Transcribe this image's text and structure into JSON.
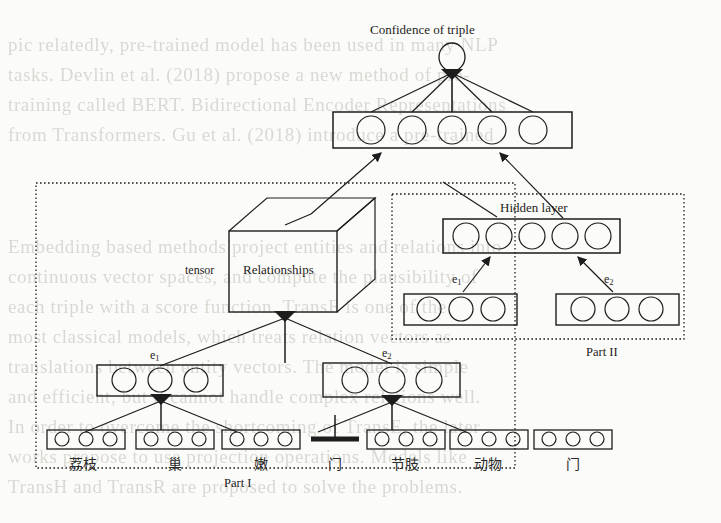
{
  "figure": {
    "title_top": "Confidence of triple",
    "cube_label": "Relationships",
    "tensor_label": "tensor",
    "hidden_layer_label": "Hidden layer",
    "part_i_label": "Part I",
    "part_ii_label": "Part II"
  },
  "entity_labels": {
    "e1": "e",
    "e1_sub": "1",
    "e2": "e",
    "e2_sub": "2"
  },
  "output_layer": {
    "name": "confidence-output-layer",
    "units": 5,
    "score_node": "confidence-score-node"
  },
  "part_i": {
    "entity_vector_units": 3,
    "token_boxes": [
      {
        "label": "荔枝",
        "units": 3,
        "masked": false
      },
      {
        "label": "巢",
        "units": 3,
        "masked": false
      },
      {
        "label": "嫩",
        "units": 3,
        "masked": false
      },
      {
        "label": "门",
        "units": 0,
        "masked": true
      },
      {
        "label": "节肢",
        "units": 3,
        "masked": false
      },
      {
        "label": "动物",
        "units": 3,
        "masked": false
      },
      {
        "label": "门",
        "units": 3,
        "masked": false
      }
    ]
  },
  "part_ii": {
    "hidden_units": 5,
    "e1_units": 3,
    "e2_units": 3
  },
  "colors": {
    "ink": "#1d1d1d",
    "paper": "#fbfbf9",
    "bleed": "#d9d9d4"
  },
  "bleed_text": [
    "pic relatedly, pre-trained model has been used in many NLP",
    "tasks. Devlin et al. (2018) propose a new method of pre-",
    "training called BERT. Bidirectional Encoder Representations",
    "from Transformers. Gu et al. (2018) introduce a pre-trained",
    "model of CNN.",
    "",
    "Embedding based methods project entities and relations into",
    "continuous vector spaces, and compute the plausibility of",
    "each triple with a score function. TransE is one of the",
    "most classical models, which treats relation vectors as",
    "translations between entity vectors. The model is simple",
    "and efficient, but it cannot handle complex relations well.",
    "In order to overcome the shortcoming of TransE, the later",
    "works propose to use projection operations. Models like",
    "TransH and TransR are proposed to solve the problems."
  ]
}
